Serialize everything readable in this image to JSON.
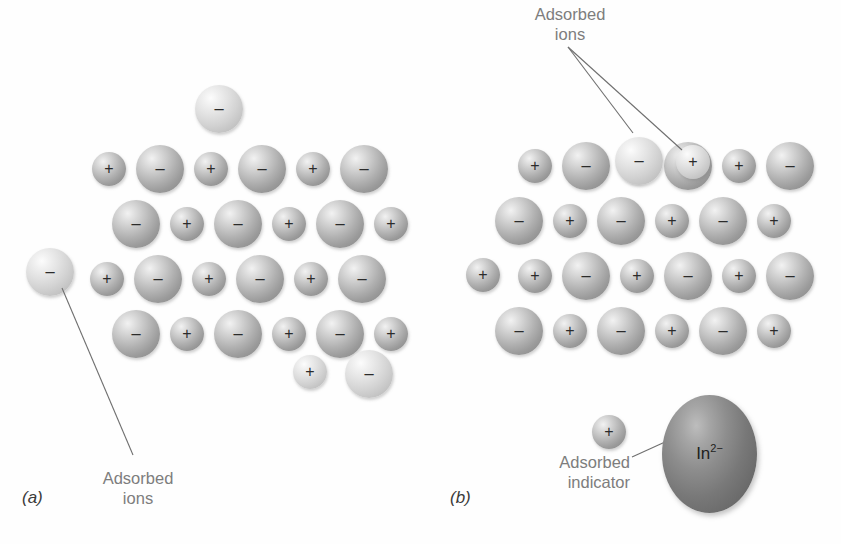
{
  "figure": {
    "background": "#ffffff",
    "ion_color": "#a8a8a8",
    "ion_light_color": "#d8d8d8",
    "indicator_color": "#7a7a7a",
    "label_color": "#7d7d7d",
    "sign_color": "#2b2b2b"
  },
  "signs": {
    "plus": "+",
    "minus": "−"
  },
  "panel_a": {
    "label": "(a)",
    "callout": {
      "line1": "Adsorbed",
      "line2": "ions"
    },
    "adsorbed_ions": [
      {
        "sign": "−",
        "size": "big",
        "tone": "light",
        "x": 195,
        "y": 85
      },
      {
        "sign": "−",
        "size": "big",
        "tone": "light",
        "x": 26,
        "y": 248
      },
      {
        "sign": "+",
        "size": "small",
        "tone": "light",
        "x": 293,
        "y": 355
      },
      {
        "sign": "−",
        "size": "big",
        "tone": "light",
        "x": 345,
        "y": 350
      }
    ],
    "lattice_rows": [
      {
        "y": 145,
        "x0": 92,
        "signs": [
          "+",
          "−",
          "+",
          "−",
          "+",
          "−"
        ]
      },
      {
        "y": 200,
        "x0": 112,
        "signs": [
          "−",
          "+",
          "−",
          "+",
          "−",
          "+"
        ]
      },
      {
        "y": 255,
        "x0": 90,
        "signs": [
          "+",
          "−",
          "+",
          "−",
          "+",
          "−"
        ]
      },
      {
        "y": 310,
        "x0": 112,
        "signs": [
          "−",
          "+",
          "−",
          "+",
          "−",
          "+"
        ]
      }
    ]
  },
  "panel_b": {
    "label": "(b)",
    "callout_top": {
      "line1": "Adsorbed",
      "line2": "ions"
    },
    "callout_indicator": {
      "line1": "Adsorbed",
      "line2": "indicator"
    },
    "indicator": {
      "text": "In",
      "charge": "2−"
    },
    "adsorbed_ions": [
      {
        "sign": "−",
        "size": "big",
        "tone": "light",
        "x": 615,
        "y": 137
      },
      {
        "sign": "+",
        "size": "small",
        "tone": "light",
        "x": 676,
        "y": 145
      },
      {
        "sign": "+",
        "size": "small",
        "tone": "normal",
        "x": 466,
        "y": 258
      },
      {
        "sign": "+",
        "size": "small",
        "tone": "normal",
        "x": 592,
        "y": 415
      }
    ],
    "lattice_rows": [
      {
        "y": 142,
        "x0": 518,
        "signs": [
          "+",
          "−",
          "+",
          "−",
          "+",
          "−"
        ]
      },
      {
        "y": 197,
        "x0": 495,
        "signs": [
          "−",
          "+",
          "−",
          "+",
          "−",
          "+"
        ]
      },
      {
        "y": 252,
        "x0": 518,
        "signs": [
          "+",
          "−",
          "+",
          "−",
          "+",
          "−"
        ]
      },
      {
        "y": 307,
        "x0": 495,
        "signs": [
          "−",
          "+",
          "−",
          "+",
          "−",
          "+"
        ]
      }
    ]
  }
}
